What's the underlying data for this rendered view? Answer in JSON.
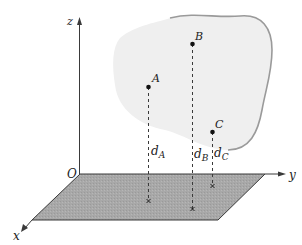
{
  "figure": {
    "axes": {
      "x": "x",
      "y": "y",
      "z": "z",
      "origin": "O"
    },
    "points": [
      {
        "name": "A",
        "distance_label": "d",
        "distance_sub": "A"
      },
      {
        "name": "B",
        "distance_label": "d",
        "distance_sub": "B"
      },
      {
        "name": "C",
        "distance_label": "d",
        "distance_sub": "C"
      }
    ],
    "colors": {
      "plane_fill": "#a9a9a9",
      "plane_edge": "#3a3a3a",
      "blob_fill": "#efefef",
      "blob_edge": "#9a9a9a",
      "axis": "#3a3a3a"
    }
  }
}
